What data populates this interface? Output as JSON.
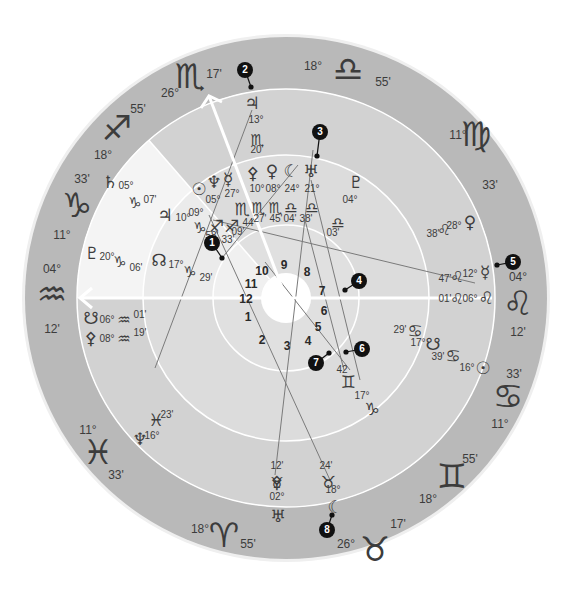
{
  "colors": {
    "background": "#ffffff",
    "outer_ring": "#b9b9b9",
    "band_dark": "#d2d2d2",
    "band_light": "#ebebeb",
    "band_lighter": "#f4f4f4",
    "ring_line": "#ffffff",
    "text": "#3c3c3c",
    "aspect_line": "#7a7a7a",
    "marker": "#111111"
  },
  "geometry": {
    "cx": 286,
    "cy": 298,
    "r_outer": 261,
    "r_zodiac": 209,
    "r_mid": 143,
    "r_inner": 73,
    "r_hole": 25
  },
  "zodiac_signs": [
    {
      "name": "aquarius",
      "glyph": "♒",
      "deg": "04°",
      "min": "12'",
      "x": 52,
      "y": 296,
      "dx": 52,
      "dy": 270,
      "mx": 52,
      "my": 330
    },
    {
      "name": "capricorn",
      "glyph": "♑",
      "deg": "11°",
      "min": "33'",
      "x": 77,
      "y": 207,
      "dx": 62,
      "dy": 236,
      "mx": 82,
      "my": 180
    },
    {
      "name": "sagittarius",
      "glyph": "♐",
      "deg": "18°",
      "min": "55'",
      "x": 117,
      "y": 130,
      "dx": 103,
      "dy": 156,
      "mx": 138,
      "my": 110
    },
    {
      "name": "scorpio",
      "glyph": "♏",
      "deg": "26°",
      "min": "17'",
      "x": 190,
      "y": 78,
      "dx": 170,
      "dy": 94,
      "mx": 214,
      "my": 75
    },
    {
      "name": "libra",
      "glyph": "♎",
      "deg": "18°",
      "min": "55'",
      "x": 348,
      "y": 71,
      "dx": 313,
      "dy": 67,
      "mx": 383,
      "my": 83
    },
    {
      "name": "virgo",
      "glyph": "♍",
      "deg": "11°",
      "min": "33'",
      "x": 476,
      "y": 136,
      "dx": 458,
      "dy": 136,
      "mx": 490,
      "my": 186
    },
    {
      "name": "leo",
      "glyph": "♌",
      "deg": "04°",
      "min": "12'",
      "x": 518,
      "y": 305,
      "dx": 518,
      "dy": 278,
      "mx": 518,
      "my": 333
    },
    {
      "name": "cancer",
      "glyph": "♋",
      "deg": "11°",
      "min": "33'",
      "x": 508,
      "y": 398,
      "dx": 500,
      "dy": 425,
      "mx": 514,
      "my": 375
    },
    {
      "name": "gemini",
      "glyph": "♊",
      "deg": "18°",
      "min": "55'",
      "x": 452,
      "y": 478,
      "dx": 428,
      "dy": 500,
      "mx": 470,
      "my": 460
    },
    {
      "name": "taurus",
      "glyph": "♉",
      "deg": "26°",
      "min": "17'",
      "x": 375,
      "y": 551,
      "dx": 346,
      "dy": 545,
      "mx": 398,
      "my": 525
    },
    {
      "name": "aries",
      "glyph": "♈",
      "deg": "18°",
      "min": "55'",
      "x": 224,
      "y": 537,
      "dx": 200,
      "dy": 530,
      "mx": 248,
      "my": 545
    },
    {
      "name": "pisces",
      "glyph": "♓",
      "deg": "11°",
      "min": "33'",
      "x": 98,
      "y": 454,
      "dx": 88,
      "dy": 431,
      "mx": 116,
      "my": 476
    }
  ],
  "house_numbers": [
    {
      "n": "1",
      "x": 248,
      "y": 318
    },
    {
      "n": "2",
      "x": 262,
      "y": 341
    },
    {
      "n": "3",
      "x": 287,
      "y": 347
    },
    {
      "n": "4",
      "x": 308,
      "y": 342
    },
    {
      "n": "5",
      "x": 318,
      "y": 328
    },
    {
      "n": "6",
      "x": 324,
      "y": 312
    },
    {
      "n": "7",
      "x": 322,
      "y": 292
    },
    {
      "n": "8",
      "x": 307,
      "y": 273
    },
    {
      "n": "9",
      "x": 284,
      "y": 266
    },
    {
      "n": "10",
      "x": 262,
      "y": 272
    },
    {
      "n": "11",
      "x": 251,
      "y": 285
    },
    {
      "n": "12",
      "x": 246,
      "y": 300
    }
  ],
  "planets": [
    {
      "name": "jupiter-top",
      "glyph": "♃",
      "x": 252,
      "y": 104,
      "labels": [
        {
          "t": "13°",
          "x": 256,
          "y": 120
        },
        {
          "t": "♏",
          "x": 257,
          "y": 140,
          "g": true
        },
        {
          "t": "20'",
          "x": 257,
          "y": 150
        }
      ]
    },
    {
      "name": "uranus-top",
      "glyph": "♅",
      "x": 311,
      "y": 172,
      "labels": [
        {
          "t": "21°",
          "x": 312,
          "y": 189
        },
        {
          "t": "♎",
          "x": 312,
          "y": 208,
          "g": true
        },
        {
          "t": "38'",
          "x": 306,
          "y": 219
        }
      ]
    },
    {
      "name": "moon-top",
      "glyph": "☾",
      "x": 291,
      "y": 172,
      "labels": [
        {
          "t": "24°",
          "x": 292,
          "y": 189
        },
        {
          "t": "♎",
          "x": 291,
          "y": 208,
          "g": true
        },
        {
          "t": "04'",
          "x": 290,
          "y": 219
        }
      ]
    },
    {
      "name": "venus-top",
      "glyph": "♀",
      "x": 272,
      "y": 172,
      "labels": [
        {
          "t": "08°",
          "x": 273,
          "y": 189
        },
        {
          "t": "♏",
          "x": 275,
          "y": 208,
          "g": true
        },
        {
          "t": "45'",
          "x": 276,
          "y": 219
        }
      ]
    },
    {
      "name": "vesta-top",
      "glyph": "⚴",
      "x": 253,
      "y": 174,
      "labels": [
        {
          "t": "10°",
          "x": 257,
          "y": 189
        },
        {
          "t": "♏",
          "x": 258,
          "y": 208,
          "g": true
        },
        {
          "t": "27'",
          "x": 260,
          "y": 219
        }
      ]
    },
    {
      "name": "pluto-upper-right",
      "glyph": "♇",
      "x": 356,
      "y": 183,
      "labels": [
        {
          "t": "04°",
          "x": 350,
          "y": 200
        },
        {
          "t": "♎",
          "x": 338,
          "y": 223,
          "g": true
        },
        {
          "t": "03'",
          "x": 333,
          "y": 233
        }
      ]
    },
    {
      "name": "mercury-upper-left",
      "glyph": "☿",
      "x": 228,
      "y": 180,
      "labels": [
        {
          "t": "27°",
          "x": 232,
          "y": 194
        }
      ]
    },
    {
      "name": "neptune-upper-left",
      "glyph": "♆",
      "x": 214,
      "y": 183,
      "labels": [
        {
          "t": "05°",
          "x": 213,
          "y": 200
        }
      ]
    },
    {
      "name": "sun-upper-left",
      "glyph": "☉",
      "x": 199,
      "y": 190,
      "labels": [
        {
          "t": "09°",
          "x": 196,
          "y": 213
        }
      ]
    },
    {
      "name": "scorpio-upper-left",
      "glyph": "♏",
      "x": 242,
      "y": 210,
      "labels": [
        {
          "t": "44",
          "x": 248,
          "y": 223
        }
      ]
    },
    {
      "name": "sagittarius-pair",
      "glyph": "♐♐",
      "x": 224,
      "y": 227,
      "labels": [
        {
          "t": "09'",
          "x": 238,
          "y": 232
        },
        {
          "t": "33'",
          "x": 228,
          "y": 240
        }
      ]
    },
    {
      "name": "saturn-left",
      "glyph": "♄",
      "x": 110,
      "y": 183,
      "labels": [
        {
          "t": "05°",
          "x": 126,
          "y": 186
        },
        {
          "t": "♑",
          "x": 135,
          "y": 203,
          "g": true
        },
        {
          "t": "07'",
          "x": 150,
          "y": 200
        }
      ]
    },
    {
      "name": "jupiter-left",
      "glyph": "♃",
      "x": 165,
      "y": 216,
      "labels": [
        {
          "t": "10°",
          "x": 183,
          "y": 218
        },
        {
          "t": "♑",
          "x": 200,
          "y": 228,
          "g": true
        },
        {
          "t": "58'",
          "x": 212,
          "y": 236
        }
      ]
    },
    {
      "name": "pluto-left",
      "glyph": "♇",
      "x": 92,
      "y": 254,
      "labels": [
        {
          "t": "20°",
          "x": 107,
          "y": 257
        },
        {
          "t": "♑",
          "x": 120,
          "y": 262,
          "g": true
        },
        {
          "t": "06'",
          "x": 136,
          "y": 268
        }
      ]
    },
    {
      "name": "node-left",
      "glyph": "☊",
      "x": 159,
      "y": 261,
      "labels": [
        {
          "t": "17°",
          "x": 176,
          "y": 265
        },
        {
          "t": "♑",
          "x": 190,
          "y": 272,
          "g": true
        },
        {
          "t": "29'",
          "x": 206,
          "y": 278
        }
      ]
    },
    {
      "name": "south-node-left",
      "glyph": "☋",
      "x": 91,
      "y": 319,
      "labels": [
        {
          "t": "06°",
          "x": 107,
          "y": 320
        },
        {
          "t": "♒",
          "x": 124,
          "y": 320,
          "g": true
        },
        {
          "t": "01'",
          "x": 140,
          "y": 315
        }
      ]
    },
    {
      "name": "vesta-left",
      "glyph": "⚴",
      "x": 91,
      "y": 339,
      "labels": [
        {
          "t": "08°",
          "x": 107,
          "y": 339
        },
        {
          "t": "♒",
          "x": 124,
          "y": 339,
          "g": true
        },
        {
          "t": "19'",
          "x": 140,
          "y": 333
        }
      ]
    },
    {
      "name": "pisces-lower-left",
      "glyph": "♓",
      "x": 156,
      "y": 421,
      "labels": [
        {
          "t": "23'",
          "x": 167,
          "y": 415
        }
      ]
    },
    {
      "name": "neptune-lower-left",
      "glyph": "♆",
      "x": 140,
      "y": 440,
      "labels": [
        {
          "t": "16°",
          "x": 152,
          "y": 436
        }
      ]
    },
    {
      "name": "vesta-bottom",
      "glyph": "⚴",
      "x": 277,
      "y": 483,
      "labels": [
        {
          "t": "12'",
          "x": 277,
          "y": 466
        },
        {
          "t": "♉",
          "x": 277,
          "y": 483,
          "g": true
        },
        {
          "t": "02°",
          "x": 277,
          "y": 497
        }
      ]
    },
    {
      "name": "uranus-bottom",
      "glyph": "♅",
      "x": 278,
      "y": 517,
      "labels": []
    },
    {
      "name": "taurus-bottom-right",
      "glyph": "♉",
      "x": 328,
      "y": 483,
      "labels": [
        {
          "t": "24'",
          "x": 326,
          "y": 466
        },
        {
          "t": "18°",
          "x": 333,
          "y": 490
        }
      ]
    },
    {
      "name": "moon-bottom",
      "glyph": "☾",
      "x": 335,
      "y": 508,
      "labels": []
    },
    {
      "name": "venus-right",
      "glyph": "♀",
      "x": 470,
      "y": 223,
      "labels": [
        {
          "t": "28°",
          "x": 454,
          "y": 226
        },
        {
          "t": "♌",
          "x": 444,
          "y": 230,
          "g": true
        },
        {
          "t": "38'",
          "x": 433,
          "y": 234
        }
      ]
    },
    {
      "name": "mercury-right",
      "glyph": "☿",
      "x": 485,
      "y": 273,
      "labels": [
        {
          "t": "12°",
          "x": 470,
          "y": 274
        },
        {
          "t": "♌",
          "x": 457,
          "y": 277,
          "g": true
        },
        {
          "t": "47'",
          "x": 445,
          "y": 279
        }
      ]
    },
    {
      "name": "leo-right",
      "glyph": "♌",
      "x": 486,
      "y": 299,
      "labels": [
        {
          "t": "06°",
          "x": 470,
          "y": 299
        },
        {
          "t": "♌",
          "x": 457,
          "y": 299,
          "g": true
        },
        {
          "t": "01'",
          "x": 445,
          "y": 299
        }
      ]
    },
    {
      "name": "cancer-right-1",
      "glyph": "♋",
      "x": 415,
      "y": 332,
      "labels": [
        {
          "t": "29'",
          "x": 400,
          "y": 330
        }
      ]
    },
    {
      "name": "south-node-right",
      "glyph": "☋",
      "x": 433,
      "y": 345,
      "labels": [
        {
          "t": "17°",
          "x": 418,
          "y": 343
        }
      ]
    },
    {
      "name": "cancer-right-2",
      "glyph": "♋",
      "x": 453,
      "y": 357,
      "labels": [
        {
          "t": "39'",
          "x": 438,
          "y": 357
        }
      ]
    },
    {
      "name": "sun-right",
      "glyph": "☉",
      "x": 483,
      "y": 369,
      "labels": [
        {
          "t": "16°",
          "x": 467,
          "y": 368
        }
      ]
    },
    {
      "name": "gemini-center",
      "glyph": "♊",
      "x": 348,
      "y": 383,
      "labels": [
        {
          "t": "42",
          "x": 342,
          "y": 370
        }
      ]
    },
    {
      "name": "capricorn-lower-right",
      "glyph": "♑",
      "x": 372,
      "y": 410,
      "labels": [
        {
          "t": "17°",
          "x": 362,
          "y": 396
        }
      ]
    }
  ],
  "markers": [
    {
      "n": "1",
      "x": 212,
      "y": 243,
      "tx": 222,
      "ty": 258
    },
    {
      "n": "2",
      "x": 245,
      "y": 70,
      "tx": 251,
      "ty": 87
    },
    {
      "n": "3",
      "x": 320,
      "y": 132,
      "tx": 317,
      "ty": 156
    },
    {
      "n": "4",
      "x": 359,
      "y": 281,
      "tx": 345,
      "ty": 290
    },
    {
      "n": "5",
      "x": 513,
      "y": 262,
      "tx": 497,
      "ty": 265
    },
    {
      "n": "6",
      "x": 362,
      "y": 349,
      "tx": 346,
      "ty": 352
    },
    {
      "n": "7",
      "x": 316,
      "y": 363,
      "tx": 329,
      "ty": 353
    },
    {
      "n": "8",
      "x": 327,
      "y": 530,
      "tx": 332,
      "ty": 515
    }
  ],
  "aspect_lines": [
    [
      252,
      110,
      155,
      368
    ],
    [
      222,
      258,
      298,
      165
    ],
    [
      311,
      180,
      360,
      380
    ],
    [
      305,
      220,
      344,
      370
    ],
    [
      213,
      220,
      475,
      283
    ],
    [
      209,
      215,
      330,
      480
    ],
    [
      265,
      262,
      350,
      370
    ],
    [
      313,
      150,
      275,
      475
    ]
  ],
  "axis_arrows": {
    "horizontal": {
      "x1": 80,
      "y1": 298,
      "x2": 492,
      "y2": 298
    },
    "mc": {
      "x1": 286,
      "y1": 298,
      "x2": 209,
      "y2": 96
    }
  },
  "house_cusps": [
    {
      "angle": 180
    },
    {
      "angle": 205
    },
    {
      "angle": 232
    },
    {
      "angle": 263
    },
    {
      "angle": 286
    },
    {
      "angle": 311
    },
    {
      "angle": 0
    },
    {
      "angle": 25
    },
    {
      "angle": 52
    },
    {
      "angle": 83
    },
    {
      "angle": 106
    },
    {
      "angle": 131
    }
  ]
}
